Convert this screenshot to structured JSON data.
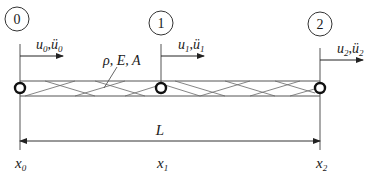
{
  "diagram": {
    "colors": {
      "line": "#4a4a4a",
      "text": "#1a1a1a",
      "node": "#111111",
      "background": "#ffffff"
    },
    "nodes": [
      {
        "id": "0",
        "label": "0",
        "x_label": "x",
        "x_sub": "0",
        "disp": "u",
        "disp_sub": "0",
        "acc": "ü",
        "acc_sub": "0"
      },
      {
        "id": "1",
        "label": "1",
        "x_label": "x",
        "x_sub": "1",
        "disp": "u",
        "disp_sub": "1",
        "acc": "ü",
        "acc_sub": "1"
      },
      {
        "id": "2",
        "label": "2",
        "x_label": "x",
        "x_sub": "2",
        "disp": "u",
        "disp_sub": "2",
        "acc": "ü",
        "acc_sub": "2"
      }
    ],
    "properties_label": "ρ, E, A",
    "length_label": "L",
    "separator": ","
  }
}
